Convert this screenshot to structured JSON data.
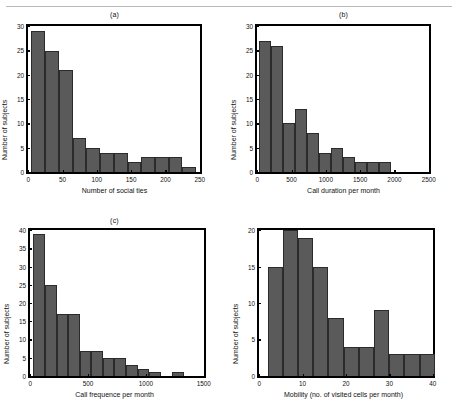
{
  "figure": {
    "background": "#ffffff",
    "bar_color": "#5a5a5a",
    "axis_color": "#000000",
    "rule_color": "#b9b9b9"
  },
  "panels": [
    {
      "id": "panel-a",
      "title": "(a)",
      "chart_data": {
        "type": "bar",
        "title": "(a)",
        "xlabel": "Number of social ties",
        "ylabel": "Number of subjects",
        "xlim": [
          0,
          250
        ],
        "ylim": [
          0,
          30
        ],
        "xticks": [
          0,
          50,
          100,
          150,
          200,
          250
        ],
        "yticks": [
          0,
          5,
          10,
          15,
          20,
          25,
          30
        ],
        "grid": false,
        "legend": null,
        "bin_width": 20,
        "bin_edges": [
          5,
          25,
          45,
          65,
          85,
          105,
          125,
          145,
          165,
          185,
          205,
          225,
          245
        ],
        "categories": [
          "5-25",
          "25-45",
          "45-65",
          "65-85",
          "85-105",
          "105-125",
          "125-145",
          "145-165",
          "165-185",
          "185-205",
          "205-225",
          "225-245"
        ],
        "values": [
          29,
          25,
          21,
          7,
          5,
          4,
          4,
          2,
          3,
          3,
          3,
          1
        ]
      }
    },
    {
      "id": "panel-b",
      "title": "(b)",
      "chart_data": {
        "type": "bar",
        "title": "(b)",
        "xlabel": "Call duration per month",
        "ylabel": "Number of subjects",
        "xlim": [
          0,
          2500
        ],
        "ylim": [
          0,
          30
        ],
        "xticks": [
          0,
          500,
          1000,
          1500,
          2000,
          2500
        ],
        "yticks": [
          0,
          5,
          10,
          15,
          20,
          25,
          30
        ],
        "grid": false,
        "legend": null,
        "bin_width": 175,
        "bin_edges": [
          25,
          200,
          375,
          550,
          725,
          900,
          1075,
          1250,
          1425,
          1600,
          1775,
          1950
        ],
        "categories": [
          "25-200",
          "200-375",
          "375-550",
          "550-725",
          "725-900",
          "900-1075",
          "1075-1250",
          "1250-1425",
          "1425-1600",
          "1600-1775",
          "1775-1950"
        ],
        "values": [
          27,
          26,
          10,
          13,
          8,
          4,
          5,
          3,
          2,
          2,
          2
        ]
      }
    },
    {
      "id": "panel-c",
      "title": "(c)",
      "chart_data": {
        "type": "bar",
        "title": "(c)",
        "xlabel": "Call frequence per month",
        "ylabel": "Number of subjects",
        "xlim": [
          0,
          1500
        ],
        "ylim": [
          0,
          40
        ],
        "xticks": [
          0,
          500,
          1000,
          1500
        ],
        "yticks": [
          0,
          5,
          10,
          15,
          20,
          25,
          30,
          35,
          40
        ],
        "grid": false,
        "legend": null,
        "bin_width": 100,
        "bin_edges": [
          30,
          130,
          230,
          330,
          430,
          530,
          630,
          730,
          830,
          930,
          1030,
          1230,
          1330,
          1430
        ],
        "categories": [
          "30-130",
          "130-230",
          "230-330",
          "330-430",
          "430-530",
          "530-630",
          "630-730",
          "730-830",
          "830-930",
          "930-1030",
          "1230-1330",
          "1330-1430"
        ],
        "values": [
          39,
          25,
          17,
          17,
          7,
          7,
          5,
          5,
          3,
          2,
          1,
          1
        ]
      }
    },
    {
      "id": "panel-d",
      "title": "",
      "chart_data": {
        "type": "bar",
        "title": "",
        "xlabel": "Mobility (no. of visited cells per month)",
        "ylabel": "Number of subjects",
        "xlim": [
          0,
          40
        ],
        "ylim": [
          0,
          20
        ],
        "xticks": [
          0,
          10,
          20,
          30,
          40
        ],
        "yticks": [
          0,
          5,
          10,
          15,
          20
        ],
        "grid": false,
        "legend": null,
        "bin_width": 3.5,
        "bin_edges": [
          2,
          5.5,
          9,
          12.5,
          16,
          19.5,
          23,
          26.5,
          30,
          33.5,
          37
        ],
        "categories": [
          "2-5.5",
          "5.5-9",
          "9-12.5",
          "12.5-16",
          "16-19.5",
          "19.5-23",
          "23-26.5",
          "26.5-30",
          "30-33.5",
          "33.5-37",
          "37-38.5"
        ],
        "values": [
          15,
          20,
          19,
          15,
          8,
          4,
          4,
          9,
          3,
          3,
          3
        ]
      }
    }
  ]
}
